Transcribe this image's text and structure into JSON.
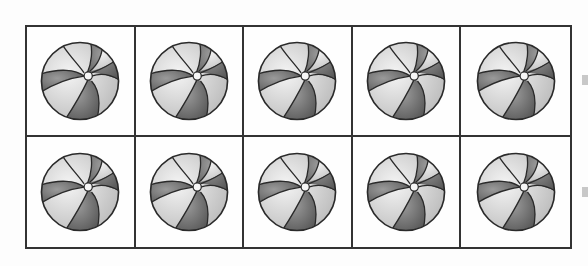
{
  "figure": {
    "rows": 2,
    "columns": 5,
    "total_cells": 10,
    "filled_cells": 10,
    "item": "beach-ball",
    "cells": [
      {
        "row": 1,
        "col": 1,
        "content": "beach-ball"
      },
      {
        "row": 1,
        "col": 2,
        "content": "beach-ball"
      },
      {
        "row": 1,
        "col": 3,
        "content": "beach-ball"
      },
      {
        "row": 1,
        "col": 4,
        "content": "beach-ball"
      },
      {
        "row": 1,
        "col": 5,
        "content": "beach-ball"
      },
      {
        "row": 2,
        "col": 1,
        "content": "beach-ball"
      },
      {
        "row": 2,
        "col": 2,
        "content": "beach-ball"
      },
      {
        "row": 2,
        "col": 3,
        "content": "beach-ball"
      },
      {
        "row": 2,
        "col": 4,
        "content": "beach-ball"
      },
      {
        "row": 2,
        "col": 5,
        "content": "beach-ball"
      }
    ]
  },
  "colors": {
    "border": "#333333",
    "ball_dark": "#6e6e6e",
    "ball_light": "#d8d8d8",
    "ball_outline": "#2a2a2a",
    "background": "#fdfdfd"
  }
}
